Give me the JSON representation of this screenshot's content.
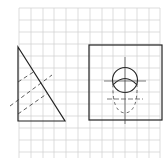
{
  "diagram": {
    "title": "",
    "colors": {
      "grid": "#c8c8c8",
      "line": "#222222",
      "background": "#ffffff"
    }
  }
}
